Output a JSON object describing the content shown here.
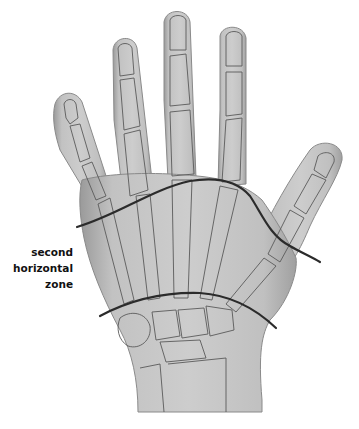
{
  "figure": {
    "label": {
      "lines": [
        "second",
        "horizontal",
        "zone"
      ]
    },
    "colors": {
      "skin": "#c6c6c6",
      "skin_shadow": "#8a8a8a",
      "bone_outline": "#5a5a5a",
      "zone_line": "#2b2b2b",
      "background": "#ffffff",
      "text": "#111111"
    },
    "zone_lines": [
      {
        "name": "upper-boundary",
        "from": [
          77,
          227
        ],
        "to": [
          320,
          262
        ]
      },
      {
        "name": "lower-boundary",
        "from": [
          100,
          316
        ],
        "to": [
          276,
          328
        ]
      }
    ]
  }
}
